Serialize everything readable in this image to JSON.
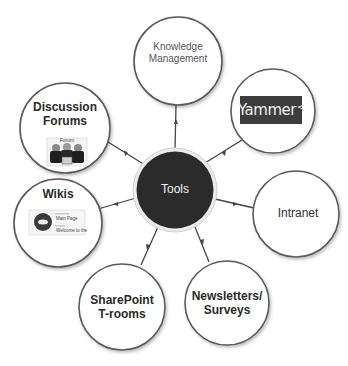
{
  "diagram": {
    "hub": {
      "label": "Tools",
      "color": "#2b2b2b"
    },
    "nodes": [
      {
        "id": "knowledge",
        "line1": "Knowledge",
        "line2": "Management"
      },
      {
        "id": "yammer",
        "logo_text": "Yammer",
        "logo_mark": "<"
      },
      {
        "id": "intranet",
        "label": "Intranet"
      },
      {
        "id": "newsletters",
        "line1": "Newsletters/",
        "line2": "Surveys"
      },
      {
        "id": "sharepoint",
        "line1": "SharePoint",
        "line2": "T-rooms"
      },
      {
        "id": "wikis",
        "label": "Wikis",
        "thumb_line1": "Main Page",
        "thumb_line2": "Welcome to the"
      },
      {
        "id": "forums",
        "line1": "Discussion",
        "line2": "Forums",
        "thumb_title": "Forum"
      }
    ],
    "colors": {
      "stroke": "#555555",
      "hub_fill": "#2b2b2b",
      "node_fill": "#ffffff",
      "logo_bg": "#3d3d3d"
    }
  }
}
